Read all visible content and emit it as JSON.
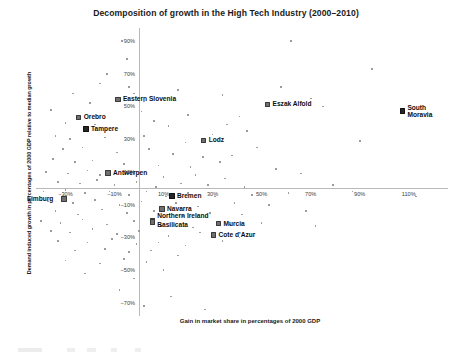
{
  "chart_data": {
    "type": "scatter",
    "title": "Decomposition of growth in the High Tech Industry (2000–2010)",
    "xlabel": "Gain in market share in percentages of 2000 GDP",
    "ylabel": "Demand induced growth in percentages of 2000 GDP relative to median growth",
    "xlim": [
      -42,
      126
    ],
    "ylim": [
      -78,
      98
    ],
    "xticks": [
      "−30%",
      "−10%",
      "10%",
      "30%",
      "50%",
      "70%",
      "90%",
      "110%"
    ],
    "xtick_values": [
      -30,
      -10,
      10,
      30,
      50,
      70,
      90,
      110
    ],
    "yticks": [
      "90%",
      "70%",
      "50%",
      "30%",
      "10%",
      "−10%",
      "−30%",
      "−50%",
      "−70%"
    ],
    "ytick_values": [
      90,
      70,
      50,
      30,
      10,
      -10,
      -30,
      -50,
      -70
    ],
    "grid": false,
    "legend": null,
    "axis_origin_lines": true,
    "labeled_points": [
      {
        "name": "Eastern Slovenia",
        "x": -9,
        "y": 55,
        "label_dx": 6,
        "label_dy": -3
      },
      {
        "name": "Eszak Alfold",
        "x": 52,
        "y": 52,
        "label_dx": 6,
        "label_dy": -3
      },
      {
        "name": "South Moravia",
        "x": 107,
        "y": 48,
        "label_dx": 6,
        "label_dy": -6
      },
      {
        "name": "Orebro",
        "x": -25,
        "y": 44,
        "label_dx": 6,
        "label_dy": -3
      },
      {
        "name": "Tampere",
        "x": -22,
        "y": 37,
        "label_dx": 6,
        "label_dy": -3
      },
      {
        "name": "Lodz",
        "x": 26,
        "y": 30,
        "label_dx": 6,
        "label_dy": -3
      },
      {
        "name": "Antwerpen",
        "x": -13,
        "y": 10,
        "label_dx": 6,
        "label_dy": -3
      },
      {
        "name": "Limburg",
        "x": -31,
        "y": -6,
        "label_dx": -36,
        "label_dy": -3
      },
      {
        "name": "Bremen",
        "x": 13,
        "y": -4,
        "label_dx": 6,
        "label_dy": -3
      },
      {
        "name": "Navarra",
        "x": 9,
        "y": -12,
        "label_dx": 6,
        "label_dy": -3
      },
      {
        "name": "Northern Ireland",
        "x": 5,
        "y": -19,
        "label_dx": 6,
        "label_dy": -7
      },
      {
        "name": "Basilicata",
        "x": 5,
        "y": -20,
        "label_dx": 6,
        "label_dy": 0
      },
      {
        "name": "Murcia",
        "x": 32,
        "y": -21,
        "label_dx": 6,
        "label_dy": -3
      },
      {
        "name": "Cote d'Azur",
        "x": 30,
        "y": -28,
        "label_dx": 6,
        "label_dy": -3
      }
    ],
    "unlabeled_points": [
      {
        "x": -7,
        "y": 90
      },
      {
        "x": 62,
        "y": 90
      },
      {
        "x": -5,
        "y": 79
      },
      {
        "x": -13,
        "y": 70
      },
      {
        "x": -16,
        "y": 64
      },
      {
        "x": -4,
        "y": 62
      },
      {
        "x": -27,
        "y": 58
      },
      {
        "x": -2,
        "y": 58
      },
      {
        "x": 16,
        "y": 60
      },
      {
        "x": 58,
        "y": 62
      },
      {
        "x": 95,
        "y": 73
      },
      {
        "x": -20,
        "y": 52
      },
      {
        "x": 2,
        "y": 53
      },
      {
        "x": 34,
        "y": 57
      },
      {
        "x": 70,
        "y": 55
      },
      {
        "x": -36,
        "y": 48
      },
      {
        "x": 1,
        "y": 47
      },
      {
        "x": 20,
        "y": 45
      },
      {
        "x": 41,
        "y": 44
      },
      {
        "x": 75,
        "y": 50
      },
      {
        "x": -30,
        "y": 40
      },
      {
        "x": -18,
        "y": 39
      },
      {
        "x": 6,
        "y": 41
      },
      {
        "x": 12,
        "y": 38
      },
      {
        "x": 36,
        "y": 39
      },
      {
        "x": 30,
        "y": 33
      },
      {
        "x": 44,
        "y": 35
      },
      {
        "x": -34,
        "y": 32
      },
      {
        "x": -28,
        "y": 30
      },
      {
        "x": -14,
        "y": 31
      },
      {
        "x": 2,
        "y": 32
      },
      {
        "x": 19,
        "y": 28
      },
      {
        "x": 48,
        "y": 25
      },
      {
        "x": 90,
        "y": 29
      },
      {
        "x": -31,
        "y": 24
      },
      {
        "x": -23,
        "y": 25
      },
      {
        "x": -9,
        "y": 22
      },
      {
        "x": 4,
        "y": 24
      },
      {
        "x": 14,
        "y": 21
      },
      {
        "x": 26,
        "y": 19
      },
      {
        "x": 38,
        "y": 20
      },
      {
        "x": -35,
        "y": 18
      },
      {
        "x": -26,
        "y": 16
      },
      {
        "x": -19,
        "y": 17
      },
      {
        "x": -6,
        "y": 15
      },
      {
        "x": 8,
        "y": 14
      },
      {
        "x": 21,
        "y": 13
      },
      {
        "x": 33,
        "y": 16
      },
      {
        "x": 56,
        "y": 12
      },
      {
        "x": -38,
        "y": 10
      },
      {
        "x": -29,
        "y": 9
      },
      {
        "x": -21,
        "y": 11
      },
      {
        "x": -16,
        "y": 8
      },
      {
        "x": -3,
        "y": 9
      },
      {
        "x": 10,
        "y": 7
      },
      {
        "x": 23,
        "y": 8
      },
      {
        "x": 35,
        "y": 6
      },
      {
        "x": 66,
        "y": 9
      },
      {
        "x": -33,
        "y": 4
      },
      {
        "x": -24,
        "y": 3
      },
      {
        "x": -17,
        "y": 5
      },
      {
        "x": -10,
        "y": 2
      },
      {
        "x": -1,
        "y": 4
      },
      {
        "x": 7,
        "y": 1
      },
      {
        "x": 17,
        "y": 3
      },
      {
        "x": 28,
        "y": 2
      },
      {
        "x": 43,
        "y": 1
      },
      {
        "x": 79,
        "y": 2
      },
      {
        "x": -39,
        "y": -2
      },
      {
        "x": -30,
        "y": -1
      },
      {
        "x": -22,
        "y": -3
      },
      {
        "x": -12,
        "y": -2
      },
      {
        "x": -4,
        "y": -4
      },
      {
        "x": 3,
        "y": -2
      },
      {
        "x": 11,
        "y": -5
      },
      {
        "x": 20,
        "y": -3
      },
      {
        "x": 31,
        "y": -5
      },
      {
        "x": 46,
        "y": -4
      },
      {
        "x": 61,
        "y": -3
      },
      {
        "x": 87,
        "y": -2
      },
      {
        "x": 113,
        "y": -5
      },
      {
        "x": -37,
        "y": -8
      },
      {
        "x": -27,
        "y": -9
      },
      {
        "x": -18,
        "y": -7
      },
      {
        "x": -8,
        "y": -10
      },
      {
        "x": 1,
        "y": -8
      },
      {
        "x": 15,
        "y": -9
      },
      {
        "x": 24,
        "y": -11
      },
      {
        "x": 39,
        "y": -9
      },
      {
        "x": 53,
        "y": -10
      },
      {
        "x": -34,
        "y": -14
      },
      {
        "x": -25,
        "y": -16
      },
      {
        "x": -15,
        "y": -13
      },
      {
        "x": -5,
        "y": -15
      },
      {
        "x": 6,
        "y": -14
      },
      {
        "x": 18,
        "y": -17
      },
      {
        "x": 29,
        "y": -15
      },
      {
        "x": 42,
        "y": -16
      },
      {
        "x": 68,
        "y": -14
      },
      {
        "x": -40,
        "y": -20
      },
      {
        "x": -32,
        "y": -21
      },
      {
        "x": -23,
        "y": -19
      },
      {
        "x": -13,
        "y": -22
      },
      {
        "x": -2,
        "y": -20
      },
      {
        "x": 9,
        "y": -23
      },
      {
        "x": 22,
        "y": -24
      },
      {
        "x": 37,
        "y": -22
      },
      {
        "x": 50,
        "y": -21
      },
      {
        "x": 72,
        "y": -23
      },
      {
        "x": -36,
        "y": -26
      },
      {
        "x": -28,
        "y": -27
      },
      {
        "x": -19,
        "y": -25
      },
      {
        "x": -9,
        "y": -28
      },
      {
        "x": 0,
        "y": -26
      },
      {
        "x": 12,
        "y": -29
      },
      {
        "x": 25,
        "y": -27
      },
      {
        "x": 41,
        "y": -30
      },
      {
        "x": -33,
        "y": -32
      },
      {
        "x": -21,
        "y": -33
      },
      {
        "x": -11,
        "y": -31
      },
      {
        "x": -1,
        "y": -34
      },
      {
        "x": 8,
        "y": -33
      },
      {
        "x": 19,
        "y": -35
      },
      {
        "x": 34,
        "y": -32
      },
      {
        "x": -26,
        "y": -38
      },
      {
        "x": -14,
        "y": -37
      },
      {
        "x": -4,
        "y": -39
      },
      {
        "x": 5,
        "y": -38
      },
      {
        "x": 16,
        "y": -41
      },
      {
        "x": -30,
        "y": -44
      },
      {
        "x": -16,
        "y": -46
      },
      {
        "x": -6,
        "y": -43
      },
      {
        "x": 3,
        "y": -45
      },
      {
        "x": -22,
        "y": -52
      },
      {
        "x": -2,
        "y": -55
      },
      {
        "x": 10,
        "y": -50
      },
      {
        "x": -8,
        "y": -62
      },
      {
        "x": 13,
        "y": -66
      },
      {
        "x": 2,
        "y": -72
      },
      {
        "x": 27,
        "y": -74
      }
    ]
  }
}
